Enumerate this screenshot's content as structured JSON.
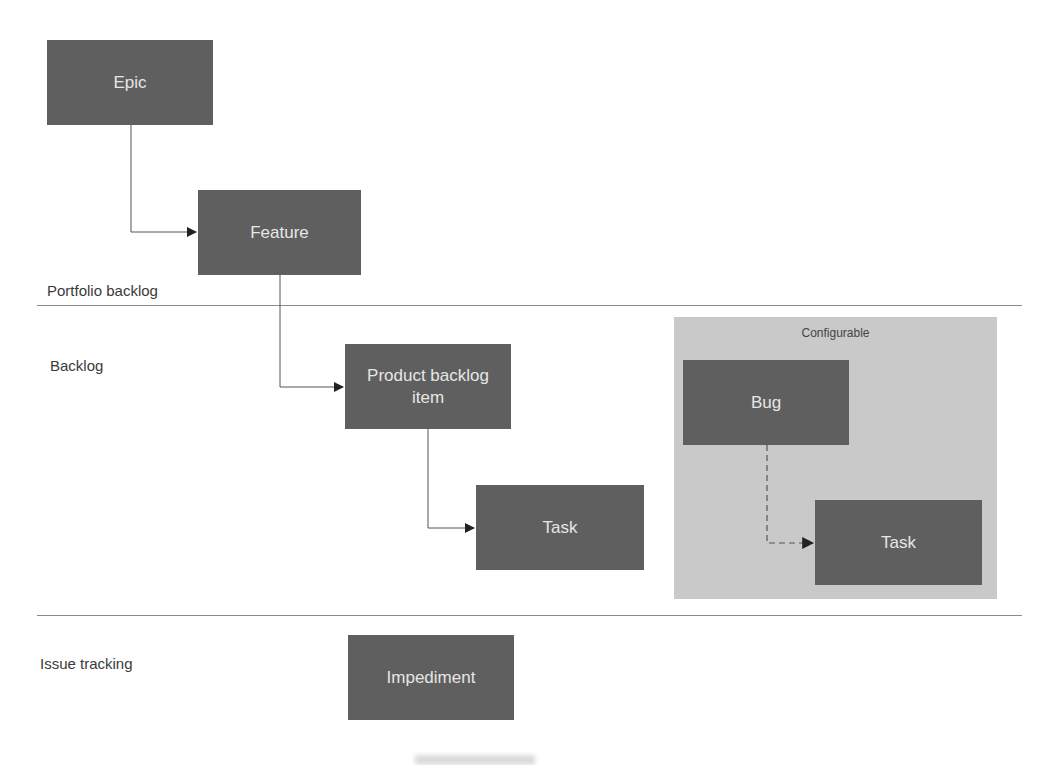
{
  "lanes": [
    {
      "id": "portfolio",
      "label": "Portfolio backlog"
    },
    {
      "id": "backlog",
      "label": "Backlog"
    },
    {
      "id": "issue",
      "label": "Issue tracking"
    }
  ],
  "nodes": {
    "epic": "Epic",
    "feature": "Feature",
    "pbi": "Product backlog item",
    "task": "Task",
    "bug": "Bug",
    "bug_task": "Task",
    "impediment": "Impediment"
  },
  "group": {
    "title": "Configurable"
  },
  "edges": [
    {
      "from": "Epic",
      "to": "Feature",
      "style": "solid"
    },
    {
      "from": "Feature",
      "to": "Product backlog item",
      "style": "solid"
    },
    {
      "from": "Product backlog item",
      "to": "Task",
      "style": "solid"
    },
    {
      "from": "Bug",
      "to": "Task",
      "style": "dashed"
    }
  ],
  "colors": {
    "node": "#5f5f5f",
    "node_text": "#e6e6e6",
    "group_bg": "#c9c9c9",
    "divider": "#8a8a8a"
  }
}
